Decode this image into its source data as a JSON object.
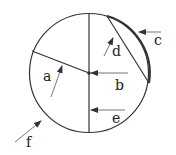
{
  "diagram": {
    "labels": {
      "a": "a",
      "b": "b",
      "c": "c",
      "d": "d",
      "e": "e",
      "f": "f"
    },
    "colors": {
      "stroke": "#333333",
      "background": "#ffffff"
    }
  }
}
